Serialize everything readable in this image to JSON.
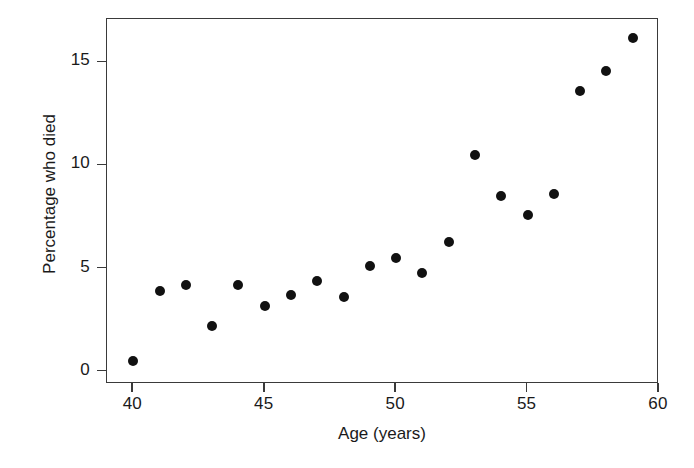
{
  "chart_data": {
    "type": "scatter",
    "title": "",
    "xlabel": "Age (years)",
    "ylabel": "Percentage who died",
    "xlim": [
      39.0,
      60.0
    ],
    "ylim": [
      -0.6,
      17.1
    ],
    "xticks": [
      40,
      45,
      50,
      55,
      60
    ],
    "xticklabels": [
      "40",
      "45",
      "50",
      "55",
      "60"
    ],
    "yticks": [
      0,
      5,
      10,
      15
    ],
    "yticklabels": [
      "0",
      "5",
      "10",
      "15"
    ],
    "grid": false,
    "legend": null,
    "marker": "filled-circle",
    "marker_color": "#111111",
    "x": [
      40,
      41,
      42,
      43,
      44,
      45,
      46,
      47,
      48,
      49,
      50,
      51,
      52,
      53,
      54,
      55,
      56,
      57,
      58,
      59
    ],
    "values": [
      0.5,
      3.9,
      4.2,
      2.2,
      4.2,
      3.2,
      3.7,
      4.4,
      3.6,
      5.1,
      5.5,
      4.8,
      6.3,
      10.5,
      8.5,
      7.6,
      8.6,
      13.6,
      14.6,
      16.2
    ],
    "points": [
      {
        "x": 40,
        "y": 0.5
      },
      {
        "x": 41,
        "y": 3.9
      },
      {
        "x": 42,
        "y": 4.2
      },
      {
        "x": 43,
        "y": 2.2
      },
      {
        "x": 44,
        "y": 4.2
      },
      {
        "x": 45,
        "y": 3.2
      },
      {
        "x": 46,
        "y": 3.7
      },
      {
        "x": 47,
        "y": 4.4
      },
      {
        "x": 48,
        "y": 3.6
      },
      {
        "x": 49,
        "y": 5.1
      },
      {
        "x": 50,
        "y": 5.5
      },
      {
        "x": 51,
        "y": 4.8
      },
      {
        "x": 52,
        "y": 6.3
      },
      {
        "x": 53,
        "y": 10.5
      },
      {
        "x": 54,
        "y": 8.5
      },
      {
        "x": 55,
        "y": 7.6
      },
      {
        "x": 56,
        "y": 8.6
      },
      {
        "x": 57,
        "y": 13.6
      },
      {
        "x": 58,
        "y": 14.6
      },
      {
        "x": 59,
        "y": 16.2
      }
    ]
  },
  "colors": {
    "axis": "#3a3a3a",
    "marker": "#111111",
    "background": "#ffffff",
    "text": "#1a1a1a"
  }
}
